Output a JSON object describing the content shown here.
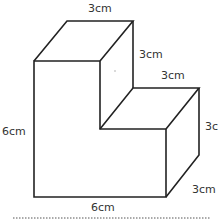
{
  "diagram": {
    "type": "3d-l-shaped-prism",
    "labels": {
      "top_width": "3cm",
      "upper_height": "3cm",
      "step_width": "3cm",
      "right_height": "3c",
      "left_height": "6cm",
      "depth": "3cm",
      "bottom_width": "6cm"
    },
    "colors": {
      "stroke": "#222222",
      "text": "#333333",
      "dashed": "#555555"
    }
  }
}
